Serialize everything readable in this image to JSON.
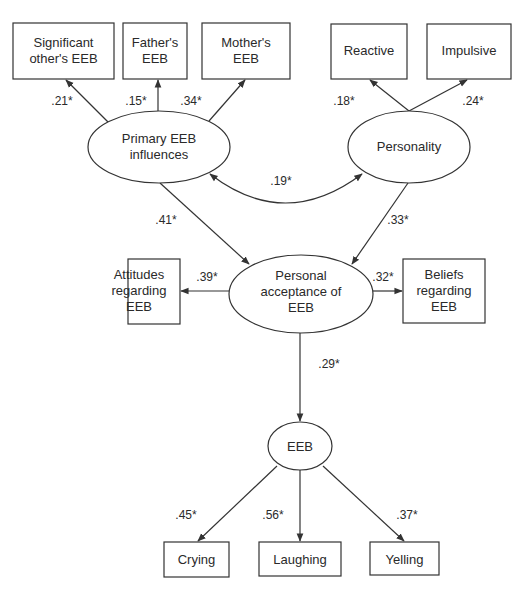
{
  "diagram": {
    "type": "structural-equation-model",
    "nodes": {
      "significant_other": {
        "shape": "box",
        "lines": [
          "Significant",
          "other's EEB"
        ]
      },
      "father": {
        "shape": "box",
        "lines": [
          "Father's",
          "EEB"
        ]
      },
      "mother": {
        "shape": "box",
        "lines": [
          "Mother's",
          "EEB"
        ]
      },
      "reactive": {
        "shape": "box",
        "lines": [
          "Reactive"
        ]
      },
      "impulsive": {
        "shape": "box",
        "lines": [
          "Impulsive"
        ]
      },
      "primary": {
        "shape": "ellipse",
        "lines": [
          "Primary EEB",
          "influences"
        ]
      },
      "personality": {
        "shape": "ellipse",
        "lines": [
          "Personality"
        ]
      },
      "acceptance": {
        "shape": "ellipse",
        "lines": [
          "Personal",
          "acceptance of",
          "EEB"
        ]
      },
      "attitudes": {
        "shape": "box",
        "lines": [
          "Attitudes",
          "regarding",
          "EEB"
        ]
      },
      "beliefs": {
        "shape": "box",
        "lines": [
          "Beliefs",
          "regarding",
          "EEB"
        ]
      },
      "eeb": {
        "shape": "ellipse",
        "lines": [
          "EEB"
        ]
      },
      "crying": {
        "shape": "box",
        "lines": [
          "Crying"
        ]
      },
      "laughing": {
        "shape": "box",
        "lines": [
          "Laughing"
        ]
      },
      "yelling": {
        "shape": "box",
        "lines": [
          "Yelling"
        ]
      }
    },
    "edges": {
      "primary_significant": {
        "from": "primary",
        "to": "significant_other",
        "coef": ".21*"
      },
      "primary_father": {
        "from": "primary",
        "to": "father",
        "coef": ".15*"
      },
      "primary_mother": {
        "from": "primary",
        "to": "mother",
        "coef": ".34*"
      },
      "personality_reactive": {
        "from": "personality",
        "to": "reactive",
        "coef": ".18*"
      },
      "personality_impulsive": {
        "from": "personality",
        "to": "impulsive",
        "coef": ".24*"
      },
      "primary_personality": {
        "from": "primary",
        "to": "personality",
        "coef": ".19*",
        "bidirectional": true
      },
      "primary_acceptance": {
        "from": "primary",
        "to": "acceptance",
        "coef": ".41*"
      },
      "personality_acceptance": {
        "from": "personality",
        "to": "acceptance",
        "coef": ".33*"
      },
      "acceptance_attitudes": {
        "from": "acceptance",
        "to": "attitudes",
        "coef": ".39*"
      },
      "acceptance_beliefs": {
        "from": "acceptance",
        "to": "beliefs",
        "coef": ".32*"
      },
      "acceptance_eeb": {
        "from": "acceptance",
        "to": "eeb",
        "coef": ".29*"
      },
      "eeb_crying": {
        "from": "eeb",
        "to": "crying",
        "coef": ".45*"
      },
      "eeb_laughing": {
        "from": "eeb",
        "to": "laughing",
        "coef": ".56*"
      },
      "eeb_yelling": {
        "from": "eeb",
        "to": "yelling",
        "coef": ".37*"
      }
    }
  }
}
